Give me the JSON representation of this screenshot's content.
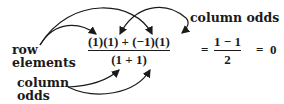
{
  "labels": {
    "row_elements_line1": "row",
    "row_elements_line2": "elements",
    "column_odds_top": "column odds",
    "column_odds_bottom_line1": "column",
    "column_odds_bottom_line2": "odds"
  },
  "equation": {
    "main_numerator": "(1)(1) + (−1)(1)",
    "main_denominator": "(1 + 1)",
    "equals_1": "=",
    "result_numerator": "1 − 1",
    "result_denominator": "2",
    "equals_2": "=",
    "final_value": "0"
  },
  "arrows": [
    {
      "from": "row elements",
      "to": "first (1) in numerator"
    },
    {
      "from": "row elements",
      "to": "(−1) in numerator"
    },
    {
      "from": "column odds (top)",
      "to": "second (1) in numerator"
    },
    {
      "from": "column odds (top)",
      "to": "last (1) in numerator"
    },
    {
      "from": "column odds (bottom)",
      "to": "first 1 in denominator"
    },
    {
      "from": "column odds (bottom)",
      "to": "second 1 in denominator"
    }
  ],
  "colors": {
    "ink": "#1a1a1a",
    "background": "#ffffff"
  }
}
